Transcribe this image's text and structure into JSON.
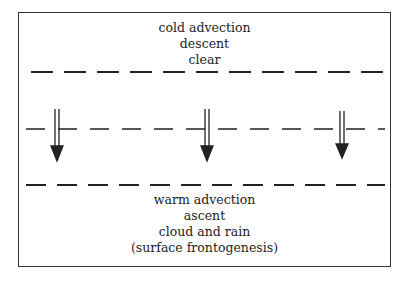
{
  "diagram": {
    "top_region": {
      "lines": [
        "cold advection",
        "descent",
        "clear"
      ]
    },
    "bottom_region": {
      "lines": [
        "warm advection",
        "ascent",
        "cloud and rain",
        "(surface frontogenesis)"
      ]
    },
    "dashed_lines": [
      {
        "id": "upper",
        "y": 72
      },
      {
        "id": "middle",
        "y": 129
      },
      {
        "id": "lower",
        "y": 185
      }
    ],
    "arrows": [
      {
        "id": "left",
        "x": 57,
        "direction": "down",
        "style": "double-shaft"
      },
      {
        "id": "center",
        "x": 207,
        "direction": "down",
        "style": "double-shaft"
      },
      {
        "id": "right",
        "x": 342,
        "direction": "down",
        "style": "double-shaft"
      }
    ],
    "colors": {
      "line": "#222222",
      "background": "#ffffff"
    }
  }
}
